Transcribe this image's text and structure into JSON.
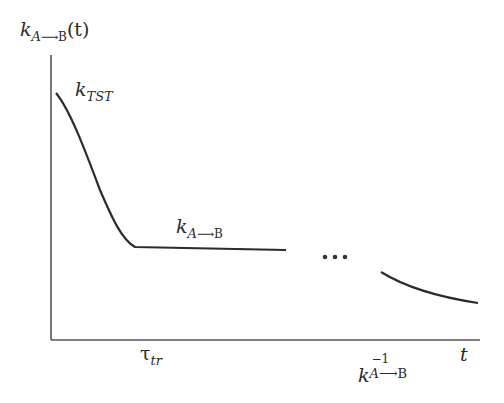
{
  "diagram": {
    "y_axis_label": {
      "base": "k",
      "sub": "A",
      "arrow": "⟶",
      "target": "B",
      "arg": "(t)"
    },
    "x_axis_label": "t",
    "curve_labels": {
      "tst": {
        "base": "k",
        "sub": "TST"
      },
      "plateau": {
        "base": "k",
        "sub": "A",
        "arrow": "⟶",
        "target": "B"
      }
    },
    "x_ticks": {
      "tau": {
        "base": "τ",
        "sub": "tr"
      },
      "inverse_rate": {
        "base": "k",
        "sup": "−1",
        "sub": "A",
        "arrow": "⟶",
        "target": "B"
      }
    },
    "ellipsis": "•••",
    "colors": {
      "line": "#2b2b2b",
      "axis": "#555555",
      "background": "#ffffff"
    }
  }
}
